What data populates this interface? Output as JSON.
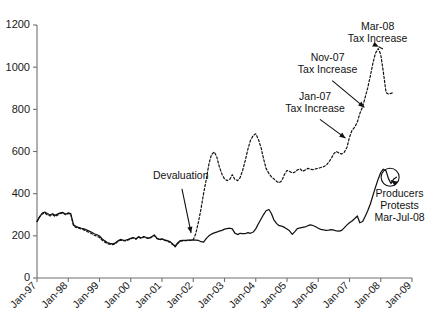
{
  "chart_data": {
    "type": "line",
    "title": "",
    "subtitle": "",
    "xlabel": "",
    "ylabel": "",
    "ylim": [
      0,
      1200
    ],
    "yticks": [
      0,
      200,
      400,
      600,
      800,
      1000,
      1200
    ],
    "ytick_labels": [
      "0",
      "200",
      "400",
      "600",
      "800",
      "1000",
      "1200"
    ],
    "xlim": [
      "Jan-97",
      "Jan-09"
    ],
    "xtick_labels": [
      "Jan-97",
      "Jan-98",
      "Jan-99",
      "Jan-00",
      "Jan-01",
      "Jan-02",
      "Jan-03",
      "Jan-04",
      "Jan-05",
      "Jan-06",
      "Jan-07",
      "Jan-08",
      "Jan-09"
    ],
    "grid": false,
    "legend_position": "none",
    "x_start_year": 1997,
    "x_end_year": 2009,
    "series": [
      {
        "name": "domestic-price-solid",
        "style": "solid",
        "color": "#111111",
        "x": [
          1997.0,
          1997.08,
          1997.17,
          1997.25,
          1997.33,
          1997.42,
          1997.5,
          1997.58,
          1997.67,
          1997.75,
          1997.83,
          1997.92,
          1998.0,
          1998.08,
          1998.17,
          1998.25,
          1998.33,
          1998.42,
          1998.5,
          1998.58,
          1998.67,
          1998.75,
          1998.83,
          1998.92,
          1999.0,
          1999.08,
          1999.17,
          1999.25,
          1999.33,
          1999.42,
          1999.5,
          1999.58,
          1999.67,
          1999.75,
          1999.83,
          1999.92,
          2000.0,
          2000.08,
          2000.17,
          2000.25,
          2000.33,
          2000.42,
          2000.5,
          2000.58,
          2000.67,
          2000.75,
          2000.83,
          2000.92,
          2001.0,
          2001.08,
          2001.17,
          2001.25,
          2001.33,
          2001.42,
          2001.5,
          2001.58,
          2001.67,
          2001.75,
          2001.83,
          2001.92,
          2002.0,
          2002.08,
          2002.17,
          2002.25,
          2002.33,
          2002.42,
          2002.5,
          2002.58,
          2002.67,
          2002.75,
          2002.83,
          2002.92,
          2003.0,
          2003.08,
          2003.17,
          2003.25,
          2003.33,
          2003.42,
          2003.5,
          2003.58,
          2003.67,
          2003.75,
          2003.83,
          2003.92,
          2004.0,
          2004.08,
          2004.17,
          2004.25,
          2004.33,
          2004.42,
          2004.5,
          2004.58,
          2004.67,
          2004.75,
          2004.83,
          2004.92,
          2005.0,
          2005.08,
          2005.17,
          2005.25,
          2005.33,
          2005.42,
          2005.5,
          2005.58,
          2005.67,
          2005.75,
          2005.83,
          2005.92,
          2006.0,
          2006.08,
          2006.17,
          2006.25,
          2006.33,
          2006.42,
          2006.5,
          2006.58,
          2006.67,
          2006.75,
          2006.83,
          2006.92,
          2007.0,
          2007.08,
          2007.17,
          2007.25,
          2007.33,
          2007.42,
          2007.5,
          2007.58,
          2007.67,
          2007.75,
          2007.83,
          2007.92,
          2008.0,
          2008.08,
          2008.17,
          2008.25,
          2008.33,
          2008.42,
          2008.5
        ],
        "values": [
          268,
          290,
          308,
          313,
          306,
          299,
          305,
          297,
          304,
          309,
          311,
          302,
          309,
          305,
          252,
          244,
          240,
          236,
          233,
          228,
          222,
          217,
          210,
          205,
          199,
          186,
          176,
          168,
          164,
          162,
          165,
          175,
          183,
          180,
          179,
          183,
          188,
          192,
          186,
          196,
          190,
          197,
          192,
          189,
          196,
          204,
          190,
          183,
          186,
          181,
          177,
          173,
          163,
          151,
          166,
          177,
          178,
          179,
          180,
          180,
          181,
          180,
          178,
          172,
          170,
          188,
          200,
          208,
          214,
          218,
          222,
          226,
          232,
          234,
          236,
          233,
          213,
          206,
          212,
          210,
          211,
          215,
          212,
          218,
          233,
          256,
          280,
          301,
          319,
          325,
          306,
          276,
          258,
          248,
          246,
          240,
          232,
          224,
          207,
          220,
          234,
          238,
          240,
          242,
          248,
          252,
          249,
          243,
          236,
          231,
          228,
          226,
          227,
          229,
          227,
          223,
          222,
          226,
          238,
          252,
          262,
          270,
          282,
          294,
          262,
          268,
          292,
          318,
          352,
          392,
          430,
          470,
          500,
          516,
          508,
          470,
          448,
          470,
          478
        ],
        "units": "index"
      },
      {
        "name": "export-price-dashed",
        "style": "dashed",
        "color": "#111111",
        "x": [
          1997.0,
          1997.08,
          1997.17,
          1997.25,
          1997.33,
          1997.42,
          1997.5,
          1997.58,
          1997.67,
          1997.75,
          1997.83,
          1997.92,
          1998.0,
          1998.08,
          1998.17,
          1998.25,
          1998.33,
          1998.42,
          1998.5,
          1998.58,
          1998.67,
          1998.75,
          1998.83,
          1998.92,
          1999.0,
          1999.08,
          1999.17,
          1999.25,
          1999.33,
          1999.42,
          1999.5,
          1999.58,
          1999.67,
          1999.75,
          1999.83,
          1999.92,
          2000.0,
          2000.08,
          2000.17,
          2000.25,
          2000.33,
          2000.42,
          2000.5,
          2000.58,
          2000.67,
          2000.75,
          2000.83,
          2000.92,
          2001.0,
          2001.08,
          2001.17,
          2001.25,
          2001.33,
          2001.42,
          2001.5,
          2001.58,
          2001.67,
          2001.75,
          2001.83,
          2001.92,
          2002.0,
          2002.08,
          2002.17,
          2002.25,
          2002.33,
          2002.42,
          2002.5,
          2002.58,
          2002.67,
          2002.75,
          2002.83,
          2002.92,
          2003.0,
          2003.08,
          2003.17,
          2003.25,
          2003.33,
          2003.42,
          2003.5,
          2003.58,
          2003.67,
          2003.75,
          2003.83,
          2003.92,
          2004.0,
          2004.08,
          2004.17,
          2004.25,
          2004.33,
          2004.42,
          2004.5,
          2004.58,
          2004.67,
          2004.75,
          2004.83,
          2004.92,
          2005.0,
          2005.08,
          2005.17,
          2005.25,
          2005.33,
          2005.42,
          2005.5,
          2005.58,
          2005.67,
          2005.75,
          2005.83,
          2005.92,
          2006.0,
          2006.08,
          2006.17,
          2006.25,
          2006.33,
          2006.42,
          2006.5,
          2006.58,
          2006.67,
          2006.75,
          2006.83,
          2006.92,
          2007.0,
          2007.08,
          2007.17,
          2007.25,
          2007.33,
          2007.42,
          2007.5,
          2007.58,
          2007.67,
          2007.75,
          2007.83,
          2007.92,
          2008.0,
          2008.08,
          2008.17,
          2008.25,
          2008.33,
          2008.42
        ],
        "values": [
          268,
          289,
          304,
          308,
          300,
          294,
          300,
          292,
          299,
          306,
          309,
          300,
          306,
          301,
          248,
          240,
          236,
          232,
          228,
          222,
          216,
          210,
          203,
          198,
          192,
          180,
          170,
          163,
          160,
          158,
          162,
          172,
          180,
          177,
          176,
          180,
          186,
          190,
          184,
          194,
          188,
          195,
          190,
          187,
          194,
          202,
          188,
          181,
          184,
          179,
          174,
          170,
          160,
          148,
          162,
          174,
          176,
          177,
          178,
          179,
          182,
          210,
          268,
          330,
          400,
          470,
          540,
          584,
          598,
          576,
          530,
          492,
          470,
          462,
          468,
          490,
          468,
          462,
          476,
          510,
          560,
          612,
          652,
          676,
          684,
          660,
          618,
          566,
          520,
          496,
          480,
          470,
          458,
          452,
          460,
          492,
          510,
          506,
          498,
          502,
          512,
          518,
          506,
          512,
          520,
          516,
          514,
          518,
          520,
          524,
          528,
          534,
          548,
          568,
          590,
          600,
          592,
          588,
          596,
          620,
          668,
          700,
          716,
          740,
          780,
          812,
          856,
          900,
          960,
          1020,
          1066,
          1088,
          1060,
          980,
          880,
          872,
          876,
          880
        ],
        "units": "index"
      }
    ],
    "annotations": [
      {
        "id": "devaluation",
        "label": "Devaluation",
        "lines": [
          "Devaluation"
        ],
        "x": 2001.6,
        "y": 470,
        "target_x": 2001.95,
        "target_y": 200
      },
      {
        "id": "jan07-tax",
        "label": "Jan-07 Tax Increase",
        "lines": [
          "Jan-07",
          "Tax Increase"
        ],
        "x": 2005.9,
        "y": 845,
        "target_x": 2006.95,
        "target_y": 655
      },
      {
        "id": "nov07-tax",
        "label": "Nov-07 Tax Increase",
        "lines": [
          "Nov-07",
          "Tax Increase"
        ],
        "x": 2006.3,
        "y": 1030,
        "target_x": 2007.55,
        "target_y": 800
      },
      {
        "id": "mar08-tax",
        "label": "Mar-08 Tax Increase",
        "lines": [
          "Mar-08",
          "Tax Increase"
        ],
        "x": 2007.9,
        "y": 1175,
        "target_x": 2008.02,
        "target_y": 1090
      },
      {
        "id": "producers-protests",
        "label": "Producers Protests Mar-Jul-08",
        "lines": [
          "Producers",
          "Protests",
          "Mar-Jul-08"
        ],
        "x": 2008.6,
        "y": 385,
        "target_x": 2008.25,
        "target_y": 470
      }
    ],
    "marks": [
      {
        "id": "protest-circle",
        "shape": "circle",
        "x": 2008.3,
        "y": 478,
        "r": 9
      }
    ]
  }
}
